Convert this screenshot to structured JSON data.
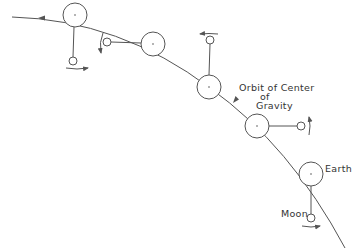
{
  "diagram": {
    "type": "orbital-diagram",
    "colors": {
      "line": "#555555",
      "text": "#333333",
      "background": "#ffffff"
    },
    "labels": {
      "orbit_line1": "Orbit of Center",
      "orbit_line2": "of",
      "orbit_line3": "Gravity",
      "earth": "Earth",
      "moon": "Moon"
    },
    "orbit_path": "M 12 17 Q 120 20 210 88 Q 290 145 345 248",
    "positions": [
      {
        "earth": {
          "x": 75,
          "y": 15,
          "r": 12
        },
        "moon": {
          "x": 73,
          "y": 61,
          "r": 4
        },
        "moon_dir": "right"
      },
      {
        "earth": {
          "x": 153,
          "y": 44,
          "r": 12
        },
        "moon": {
          "x": 107,
          "y": 42,
          "r": 4
        },
        "moon_dir": "down"
      },
      {
        "earth": {
          "x": 209,
          "y": 87,
          "r": 12
        },
        "moon": {
          "x": 210,
          "y": 40,
          "r": 4
        },
        "moon_dir": "left"
      },
      {
        "earth": {
          "x": 257,
          "y": 126,
          "r": 12
        },
        "moon": {
          "x": 301,
          "y": 126,
          "r": 4
        },
        "moon_dir": "up"
      },
      {
        "earth": {
          "x": 311,
          "y": 174,
          "r": 12
        },
        "moon": {
          "x": 311,
          "y": 218,
          "r": 4
        },
        "moon_dir": "right"
      }
    ]
  }
}
